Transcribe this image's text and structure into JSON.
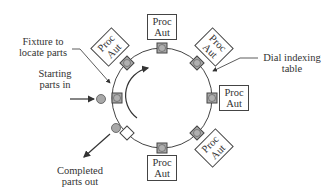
{
  "diagram": {
    "type": "rotary indexing machine",
    "labels": {
      "fixture": [
        "Fixture to",
        "locate parts"
      ],
      "starting": [
        "Starting",
        "parts in"
      ],
      "dial": [
        "Dial indexing",
        "table"
      ],
      "completed": [
        "Completed",
        "parts out"
      ]
    },
    "stations": [
      {
        "line1": "Proc",
        "line2": "Aut"
      },
      {
        "line1": "Proc",
        "line2": "Aut"
      },
      {
        "line1": "Proc",
        "line2": "Aut"
      },
      {
        "line1": "Proc",
        "line2": "Aut"
      },
      {
        "line1": "Proc",
        "line2": "Aut"
      },
      {
        "line1": "Proc",
        "line2": "Aut"
      }
    ],
    "colors": {
      "line": "#444444",
      "part_fill": "#a8a8a8",
      "background": "#ffffff"
    }
  }
}
